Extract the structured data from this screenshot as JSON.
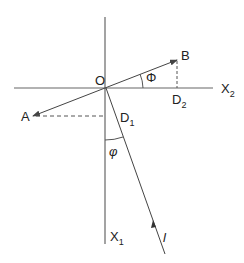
{
  "diagram": {
    "type": "vector-geometry",
    "origin_label": "O",
    "axes": {
      "horizontal": {
        "label": "X",
        "subscript": "2"
      },
      "vertical": {
        "label": "X",
        "subscript": "1"
      }
    },
    "vectors": [
      {
        "label": "B",
        "from": "O",
        "direction": "up-right"
      },
      {
        "label": "A",
        "from": "O",
        "direction": "down-left"
      },
      {
        "label": "l",
        "direction": "toward O from lower right"
      }
    ],
    "projections": [
      {
        "label": "D",
        "subscript": "2",
        "from": "B",
        "onto": "X2"
      },
      {
        "label": "D",
        "subscript": "1",
        "from": "A",
        "onto": "X1"
      }
    ],
    "angles": [
      {
        "label": "Φ",
        "between": "OB and X2"
      },
      {
        "label": "φ",
        "between": "l and X1"
      }
    ],
    "colors": {
      "line": "#555555",
      "text": "#222222"
    }
  }
}
